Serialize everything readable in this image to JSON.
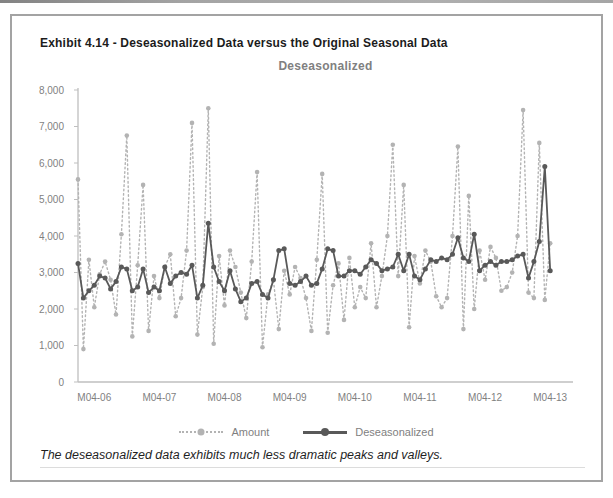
{
  "exhibit_title": "Exhibit 4.14 - Deseasonalized Data versus the Original Seasonal Data",
  "caption": "The deseasonalized data exhibits much less dramatic peaks and valleys.",
  "colors": {
    "amount_series": "#b3b3b3",
    "deseasonalized_series": "#595959",
    "axis": "#bfbfbf",
    "tick_labels": "#7f7f7f",
    "chart_title": "#808080",
    "exhibit_title": "#1c1c1c",
    "figure_border": "#a3a3a3"
  },
  "chart_data": {
    "type": "line",
    "title": "Deseasonalized",
    "xlabel": "",
    "ylabel": "",
    "ylim": [
      0,
      8000
    ],
    "grid": false,
    "legend_position": "bottom",
    "n_points": 88,
    "y_tick_labels": [
      "0",
      "1,000",
      "2,000",
      "3,000",
      "4,000",
      "5,000",
      "6,000",
      "7,000",
      "8,000"
    ],
    "y_tick_values": [
      0,
      1000,
      2000,
      3000,
      4000,
      5000,
      6000,
      7000,
      8000
    ],
    "x_tick_labels": [
      "M04-06",
      "M04-07",
      "M04-08",
      "M04-09",
      "M04-10",
      "M04-11",
      "M04-12",
      "M04-13"
    ],
    "x_tick_month_indices": [
      3,
      15,
      27,
      39,
      51,
      63,
      75,
      87
    ],
    "series": [
      {
        "name": "Amount",
        "style": "dotted",
        "marker": "circle",
        "color": "#b3b3b3",
        "values": [
          5550,
          900,
          3350,
          2050,
          2950,
          3300,
          2800,
          1850,
          4050,
          6750,
          1250,
          3200,
          5400,
          1400,
          2900,
          2300,
          3150,
          3500,
          1800,
          2300,
          3600,
          7100,
          1300,
          2600,
          7500,
          1050,
          3450,
          2100,
          3600,
          3150,
          2450,
          1750,
          3300,
          5750,
          950,
          2400,
          2800,
          1450,
          3050,
          2400,
          3150,
          2850,
          2300,
          1400,
          3350,
          5700,
          1350,
          2650,
          3250,
          1700,
          3400,
          2050,
          2600,
          2300,
          3800,
          2050,
          2900,
          4000,
          6500,
          2900,
          5400,
          1500,
          3450,
          2700,
          3600,
          3300,
          2350,
          2050,
          2300,
          4000,
          6450,
          1450,
          5100,
          2000,
          3600,
          2800,
          3700,
          3400,
          2500,
          2600,
          3000,
          4000,
          7450,
          2450,
          2300,
          6550,
          2250,
          3800
        ]
      },
      {
        "name": "Deseasonalized",
        "style": "solid",
        "marker": "circle",
        "color": "#595959",
        "values": [
          3250,
          2300,
          2500,
          2650,
          2900,
          2850,
          2550,
          2750,
          3150,
          3100,
          2500,
          2600,
          3100,
          2450,
          2600,
          2500,
          3150,
          2700,
          2900,
          3000,
          2950,
          3200,
          2300,
          2650,
          4350,
          3150,
          2750,
          2500,
          3050,
          2550,
          2200,
          2300,
          2700,
          2750,
          2400,
          2300,
          2800,
          3600,
          3650,
          2700,
          2650,
          2750,
          2900,
          2650,
          2700,
          3100,
          3650,
          3600,
          2900,
          2900,
          3050,
          3050,
          2950,
          3150,
          3350,
          3250,
          3050,
          3100,
          3150,
          3500,
          3050,
          3500,
          2900,
          2800,
          3100,
          3350,
          3300,
          3400,
          3350,
          3500,
          3950,
          3400,
          3300,
          4050,
          3050,
          3200,
          3300,
          3200,
          3300,
          3300,
          3350,
          3450,
          3500,
          2850,
          3300,
          3850,
          5900,
          3050
        ]
      }
    ]
  }
}
